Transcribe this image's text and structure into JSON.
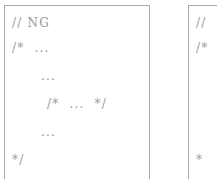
{
  "figure": {
    "background_color": "#ffffff",
    "text_color": "#9a9a9a",
    "border_color": "#a8a8a8"
  },
  "panels": [
    {
      "id": "left-example",
      "label": "ng-example",
      "lines": [
        {
          "indent": 0,
          "text": "// NG"
        },
        {
          "indent": 1,
          "text": "/*  ..."
        },
        {
          "indent": 2,
          "text": "..."
        },
        {
          "indent": 2,
          "text": "/*  ...  */"
        },
        {
          "indent": 2,
          "text": "..."
        },
        {
          "indent": 0,
          "text": "*/"
        }
      ]
    },
    {
      "id": "right-example",
      "label": "second-example-clipped",
      "lines": [
        {
          "indent": 0,
          "text": "//"
        },
        {
          "indent": 1,
          "text": "/*"
        },
        {
          "indent": 2,
          "text": ""
        },
        {
          "indent": 2,
          "text": ""
        },
        {
          "indent": 2,
          "text": ""
        },
        {
          "indent": 0,
          "text": "*"
        }
      ]
    }
  ]
}
